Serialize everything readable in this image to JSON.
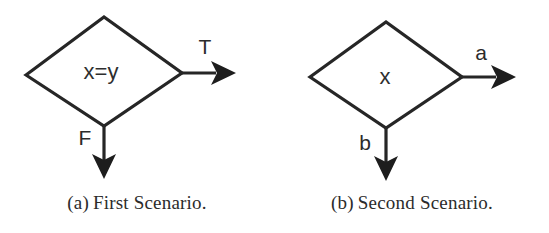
{
  "figure": {
    "background_color": "#ffffff",
    "ink_color": "#262626",
    "subfigures": [
      {
        "id": "a",
        "caption_tag": "(a)",
        "caption_text": "First Scenario.",
        "decision": {
          "shape": "diamond",
          "label": "x=y"
        },
        "branches": [
          {
            "name": "true-branch",
            "label": "T",
            "direction": "right"
          },
          {
            "name": "false-branch",
            "label": "F",
            "direction": "down"
          }
        ]
      },
      {
        "id": "b",
        "caption_tag": "(b)",
        "caption_text": "Second Scenario.",
        "decision": {
          "shape": "diamond",
          "label": "x"
        },
        "branches": [
          {
            "name": "a-branch",
            "label": "a",
            "direction": "right"
          },
          {
            "name": "b-branch",
            "label": "b",
            "direction": "down"
          }
        ]
      }
    ]
  }
}
